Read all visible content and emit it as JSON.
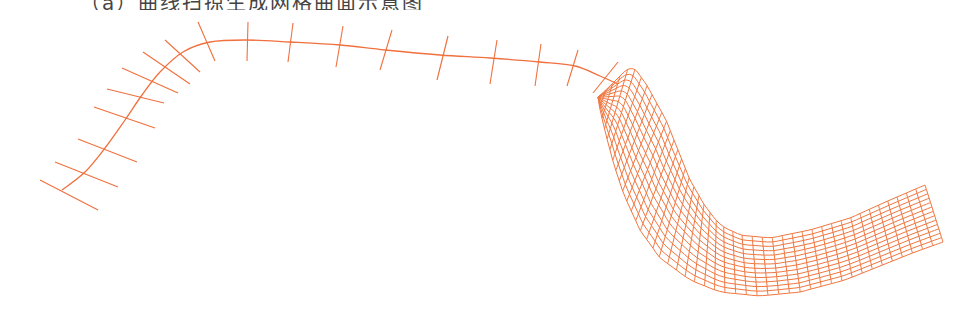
{
  "caption": {
    "text": "（a）曲线扫掠生成网格曲面示意图",
    "visible": "top edge only, glyphs cropped"
  },
  "colors": {
    "stroke": "#F0703E",
    "mesh": "#F0763F",
    "background": "#FFFFFF"
  },
  "left_figure": {
    "label": "spine-curve-with-normal-ticks",
    "spine": [
      [
        62,
        190
      ],
      [
        85,
        172
      ],
      [
        105,
        148
      ],
      [
        125,
        120
      ],
      [
        142,
        95
      ],
      [
        160,
        72
      ],
      [
        183,
        52
      ],
      [
        210,
        42
      ],
      [
        245,
        40
      ],
      [
        290,
        42
      ],
      [
        340,
        45
      ],
      [
        385,
        50
      ],
      [
        440,
        55
      ],
      [
        490,
        58
      ],
      [
        540,
        62
      ],
      [
        575,
        66
      ],
      [
        600,
        76
      ],
      [
        618,
        84
      ]
    ],
    "ticks": [
      {
        "c": [
          60,
          192
        ],
        "a": [
          40,
          180
        ],
        "b": [
          98,
          210
        ]
      },
      {
        "c": [
          85,
          173
        ],
        "a": [
          55,
          162
        ],
        "b": [
          118,
          187
        ]
      },
      {
        "c": [
          105,
          148
        ],
        "a": [
          78,
          139
        ],
        "b": [
          137,
          162
        ]
      },
      {
        "c": [
          123,
          118
        ],
        "a": [
          94,
          107
        ],
        "b": [
          155,
          128
        ]
      },
      {
        "c": [
          134,
          97
        ],
        "a": [
          107,
          89
        ],
        "b": [
          164,
          103
        ]
      },
      {
        "c": [
          153,
          76
        ],
        "a": [
          122,
          68
        ],
        "b": [
          178,
          93
        ]
      },
      {
        "c": [
          168,
          63
        ],
        "a": [
          143,
          52
        ],
        "b": [
          190,
          84
        ]
      },
      {
        "c": [
          183,
          54
        ],
        "a": [
          165,
          40
        ],
        "b": [
          200,
          72
        ]
      },
      {
        "c": [
          205,
          43
        ],
        "a": [
          198,
          22
        ],
        "b": [
          215,
          61
        ]
      },
      {
        "c": [
          248,
          41
        ],
        "a": [
          248,
          22
        ],
        "b": [
          247,
          61
        ]
      },
      {
        "c": [
          290,
          42
        ],
        "a": [
          293,
          23
        ],
        "b": [
          288,
          62
        ]
      },
      {
        "c": [
          340,
          44
        ],
        "a": [
          343,
          26
        ],
        "b": [
          336,
          67
        ]
      },
      {
        "c": [
          387,
          51
        ],
        "a": [
          392,
          30
        ],
        "b": [
          380,
          70
        ]
      },
      {
        "c": [
          443,
          58
        ],
        "a": [
          448,
          36
        ],
        "b": [
          437,
          80
        ]
      },
      {
        "c": [
          493,
          61
        ],
        "a": [
          497,
          40
        ],
        "b": [
          490,
          84
        ]
      },
      {
        "c": [
          537,
          64
        ],
        "a": [
          541,
          44
        ],
        "b": [
          535,
          86
        ]
      },
      {
        "c": [
          573,
          68
        ],
        "a": [
          578,
          50
        ],
        "b": [
          567,
          86
        ]
      },
      {
        "c": [
          605,
          78
        ],
        "a": [
          618,
          62
        ],
        "b": [
          593,
          93
        ]
      }
    ]
  },
  "right_figure": {
    "label": "swept-grid-surface",
    "outer_edge": [
      [
        598,
        97
      ],
      [
        608,
        88
      ],
      [
        622,
        74
      ],
      [
        632,
        66
      ],
      [
        645,
        82
      ],
      [
        655,
        100
      ],
      [
        666,
        120
      ],
      [
        678,
        150
      ],
      [
        690,
        180
      ],
      [
        705,
        206
      ],
      [
        720,
        225
      ],
      [
        740,
        235
      ],
      [
        770,
        238
      ],
      [
        810,
        230
      ],
      [
        850,
        218
      ],
      [
        890,
        200
      ],
      [
        925,
        185
      ]
    ],
    "inner_edge": [
      [
        598,
        97
      ],
      [
        600,
        110
      ],
      [
        606,
        135
      ],
      [
        614,
        165
      ],
      [
        624,
        195
      ],
      [
        640,
        230
      ],
      [
        660,
        258
      ],
      [
        690,
        280
      ],
      [
        720,
        292
      ],
      [
        760,
        296
      ],
      [
        800,
        292
      ],
      [
        845,
        280
      ],
      [
        885,
        264
      ],
      [
        915,
        252
      ],
      [
        943,
        242
      ]
    ],
    "columns": 44,
    "rows": 13
  }
}
